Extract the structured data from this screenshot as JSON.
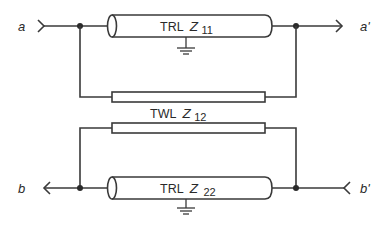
{
  "diagram": {
    "type": "transmission-line coupling network",
    "colors": {
      "stroke": "#3a3a3a",
      "text": "#2a2a2a",
      "background": "#ffffff"
    },
    "ports": {
      "a": {
        "label": "a",
        "direction": "input"
      },
      "a_prime": {
        "label": "a'",
        "direction": "output"
      },
      "b": {
        "label": "b",
        "direction": "output"
      },
      "b_prime": {
        "label": "b'",
        "direction": "input"
      }
    },
    "elements": {
      "trl_11": {
        "prefix": "TRL",
        "symbol": "Z",
        "subscript": "11"
      },
      "twl_12": {
        "prefix": "TWL",
        "symbol": "Z",
        "subscript": "12"
      },
      "trl_22": {
        "prefix": "TRL",
        "symbol": "Z",
        "subscript": "22"
      }
    }
  }
}
